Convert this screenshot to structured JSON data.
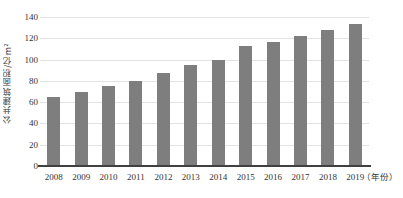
{
  "chart_data": {
    "type": "bar",
    "title": "",
    "subtitle": "",
    "xlabel": "（年份）",
    "ylabel": "公共建筑面积/亿m²",
    "categories": [
      "2008",
      "2009",
      "2010",
      "2011",
      "2012",
      "2013",
      "2014",
      "2015",
      "2016",
      "2017",
      "2018",
      "2019"
    ],
    "values": [
      65,
      70,
      75,
      79.5,
      87,
      94.5,
      99.5,
      112.5,
      116.5,
      122.5,
      127.5,
      133.5
    ],
    "series": [
      {
        "name": "公共建筑面积",
        "values": [
          65,
          70,
          75,
          79.5,
          87,
          94.5,
          99.5,
          112.5,
          116.5,
          122.5,
          127.5,
          133.5
        ]
      }
    ],
    "ylim": [
      0,
      140
    ],
    "y_ticks": [
      0,
      20,
      40,
      60,
      80,
      100,
      120,
      140
    ],
    "y_tick_labels": [
      "0",
      "20",
      "40",
      "60",
      "80",
      "100",
      "120",
      "140"
    ],
    "grid": "horizontal",
    "legend": "none",
    "bar_color": "#7e7e7e",
    "gridline_color": "#e3e3e3",
    "axis_color": "#404040",
    "background_color": "#ffffff"
  }
}
